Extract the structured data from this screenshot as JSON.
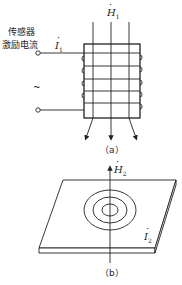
{
  "figure_a": {
    "caption": "（a）",
    "sensor_label_line1": "传感器",
    "sensor_label_line2": "激励电流",
    "current_symbol": "I",
    "current_subscript": "1",
    "field_symbol": "H",
    "field_subscript": "1",
    "ac_symbol": "~"
  },
  "figure_b": {
    "caption": "（b）",
    "field_symbol": "H",
    "field_subscript": "2",
    "current_symbol": "I",
    "current_subscript": "2"
  }
}
